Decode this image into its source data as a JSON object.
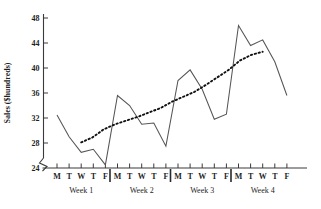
{
  "chart_data": {
    "type": "line",
    "title": "",
    "xlabel": "",
    "ylabel": "Sales ($hundreds)",
    "ylim": [
      24,
      48
    ],
    "y_ticks": [
      24,
      28,
      32,
      36,
      40,
      44,
      48
    ],
    "axis_break": true,
    "grid": false,
    "legend": "none",
    "x_tick_labels": [
      "M",
      "T",
      "W",
      "T",
      "F",
      "M",
      "T",
      "W",
      "T",
      "F",
      "M",
      "T",
      "W",
      "T",
      "F",
      "M",
      "T",
      "W",
      "T",
      "F"
    ],
    "group_labels": [
      "Week 1",
      "Week 2",
      "Week 3",
      "Week 4"
    ],
    "group_size": 5,
    "series": [
      {
        "name": "Sales",
        "style": "solid",
        "values": [
          32.5,
          29.0,
          26.5,
          27.0,
          24.5,
          35.6,
          34.0,
          31.0,
          31.2,
          27.5,
          38.0,
          39.7,
          36.6,
          31.8,
          32.6,
          46.8,
          43.6,
          44.5,
          41.0,
          35.6
        ]
      },
      {
        "name": "Trend",
        "style": "dotted",
        "x_start_index": 2,
        "x_end_index": 17,
        "values": [
          28.1,
          28.9,
          30.2,
          31.0,
          31.6,
          32.2,
          32.9,
          33.6,
          34.6,
          35.4,
          36.2,
          37.3,
          38.5,
          39.7,
          41.2,
          42.1,
          42.6
        ]
      }
    ]
  }
}
